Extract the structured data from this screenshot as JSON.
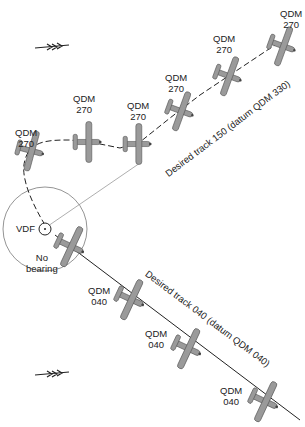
{
  "diagram": {
    "wind_arrows": [
      {
        "x": 35,
        "y": 45,
        "name": "wind-arrow-top"
      },
      {
        "x": 35,
        "y": 373,
        "name": "wind-arrow-bottom"
      }
    ],
    "station": {
      "label": "VDF",
      "cx": 45,
      "cy": 229,
      "r": 6
    },
    "no_bearing": {
      "line1": "No",
      "line2": "bearing"
    },
    "tracks": {
      "upper": "Desired track 150 (datum QDM 330)",
      "lower": "Desired track 040 (datum QDM 040)"
    },
    "upper_aircraft": [
      {
        "qdm": "QDM",
        "value": "270",
        "lx": 15,
        "ly": 127
      },
      {
        "qdm": "QDM",
        "value": "270",
        "lx": 73,
        "ly": 93
      },
      {
        "qdm": "QDM",
        "value": "270",
        "lx": 127,
        "ly": 100
      },
      {
        "qdm": "QDM",
        "value": "270",
        "lx": 165,
        "ly": 72
      },
      {
        "qdm": "QDM",
        "value": "270",
        "lx": 213,
        "ly": 33
      },
      {
        "qdm": "QDM",
        "value": "270",
        "lx": 280,
        "ly": 8
      }
    ],
    "lower_aircraft": [
      {
        "qdm": "QDM",
        "value": "040",
        "lx": 88,
        "ly": 285
      },
      {
        "qdm": "QDM",
        "value": "040",
        "lx": 145,
        "ly": 328
      },
      {
        "qdm": "QDM",
        "value": "040",
        "lx": 220,
        "ly": 385
      }
    ],
    "colors": {
      "aircraft_fill": "#9a9a9a",
      "aircraft_stroke": "#555555",
      "line": "#333333"
    }
  }
}
